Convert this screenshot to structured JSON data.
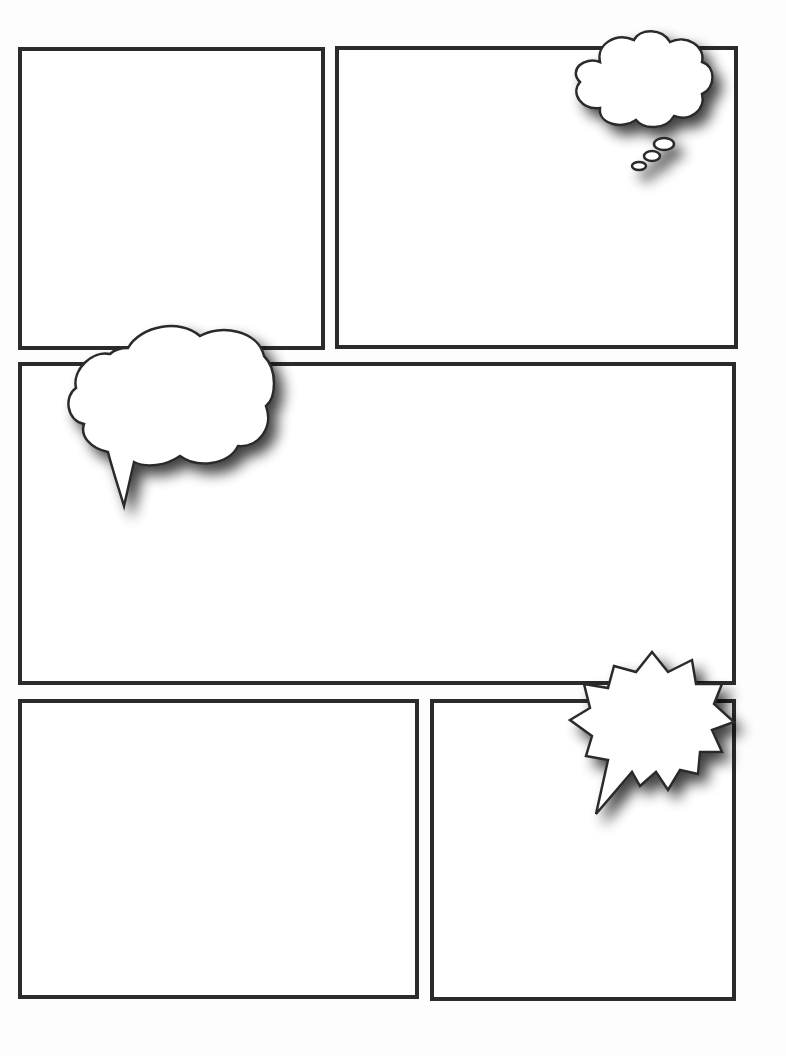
{
  "page": {
    "type": "comic-template",
    "background": "#ffffff",
    "border_color": "#2b2b2b"
  },
  "panels": [
    {
      "id": "panel-1",
      "x": 18,
      "y": 47,
      "w": 307,
      "h": 303
    },
    {
      "id": "panel-2",
      "x": 335,
      "y": 46,
      "w": 403,
      "h": 303
    },
    {
      "id": "panel-3",
      "x": 18,
      "y": 362,
      "w": 718,
      "h": 323
    },
    {
      "id": "panel-4",
      "x": 18,
      "y": 699,
      "w": 401,
      "h": 300
    },
    {
      "id": "panel-5",
      "x": 430,
      "y": 699,
      "w": 306,
      "h": 302
    }
  ],
  "bubbles": [
    {
      "id": "thought-bubble",
      "kind": "thought",
      "panel": "panel-2",
      "text": ""
    },
    {
      "id": "speech-bubble",
      "kind": "speech-cloud",
      "panel": "panel-3",
      "text": ""
    },
    {
      "id": "shout-bubble",
      "kind": "burst",
      "panel": "panel-5",
      "text": ""
    }
  ]
}
